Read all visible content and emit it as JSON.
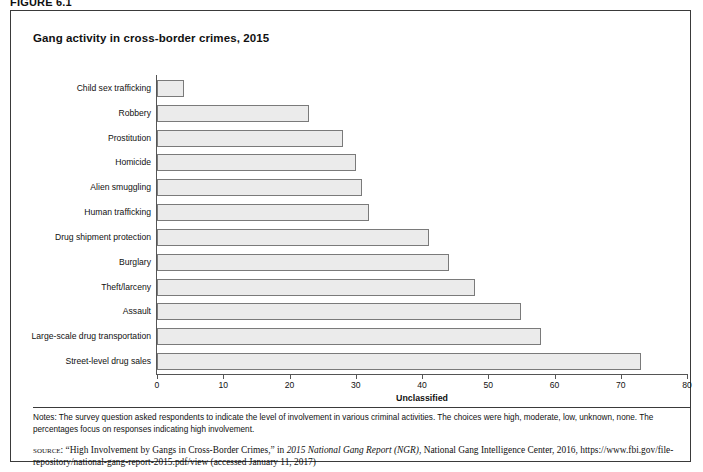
{
  "figure": {
    "label": "FIGURE 6.1"
  },
  "chart_title": "Gang activity in cross-border crimes, 2015",
  "chart_data": {
    "type": "bar",
    "orientation": "horizontal",
    "title": "Gang activity in cross-border crimes, 2015",
    "xlabel": "Unclassified",
    "ylabel": "",
    "xlim": [
      0,
      80
    ],
    "xticks": [
      0,
      10,
      20,
      30,
      40,
      50,
      60,
      70,
      80
    ],
    "grid": false,
    "legend": null,
    "bar_fill_color": "#ebebeb",
    "bar_border_color": "#7a7a7a",
    "categories": [
      "Child sex trafficking",
      "Robbery",
      "Prostitution",
      "Homicide",
      "Alien smuggling",
      "Human trafficking",
      "Drug shipment protection",
      "Burglary",
      "Theft/larceny",
      "Assault",
      "Large-scale drug transportation",
      "Street-level drug sales"
    ],
    "values": [
      4,
      23,
      28,
      30,
      31,
      32,
      41,
      44,
      48,
      55,
      58,
      73
    ]
  },
  "notes": {
    "text": "Notes: The survey question asked respondents to indicate the level of involvement in various criminal activities. The choices were high, moderate, low, unknown, none. The percentages focus on responses indicating high involvement."
  },
  "source": {
    "kicker": "source:",
    "part1": " “High Involvement by Gangs in Cross-Border Crimes,” in ",
    "italic1": "2015 National Gang Report (NGR)",
    "part2": ", National Gang Intelligence Center, 2016, https://www.fbi.gov/file-repository/national-gang-report-2015.pdf/view (accessed January 11, 2017)"
  }
}
